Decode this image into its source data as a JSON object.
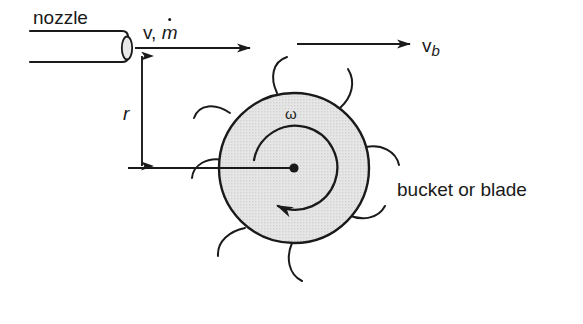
{
  "figure": {
    "background_color": "#ffffff",
    "line_color": "#1a1a1a",
    "wheel_fill_color": "#e2e2e2"
  },
  "labels": {
    "nozzle": "nozzle",
    "jet_velocity_v": "v,",
    "jet_massflow_mdot": "m",
    "bucket_velocity": "v",
    "bucket_velocity_sub": "b",
    "radius": "r",
    "angular_velocity": "ω",
    "bucket_or_blade": "bucket or blade"
  },
  "geometry": {
    "nozzle": {
      "x_start": 30,
      "x_end": 128,
      "y_top": 31,
      "y_bottom": 62,
      "tip_ellipse_cx": 127,
      "tip_ellipse_cy": 47,
      "tip_ellipse_rx": 5,
      "tip_ellipse_ry": 12
    },
    "jet_arrow": {
      "x_start": 135,
      "x_end": 252,
      "y": 48
    },
    "bucket_velocity_arrow": {
      "x_start": 300,
      "x_end": 412,
      "y": 44
    },
    "radius_arrow": {
      "x": 142,
      "y_top": 54,
      "y_bottom": 168
    },
    "centerline": {
      "x_start": 128,
      "x_end": 294,
      "y": 168
    },
    "wheel": {
      "center_x": 294,
      "center_y": 168,
      "radius": 75,
      "hub_radius": 4.5
    },
    "omega_arc": {
      "center_x": 294,
      "center_y": 168,
      "radius": 42,
      "start_deg": 160,
      "sweep_deg": 250
    },
    "buckets_angles_deg": [
      90,
      145,
      200,
      255,
      310,
      20
    ]
  }
}
